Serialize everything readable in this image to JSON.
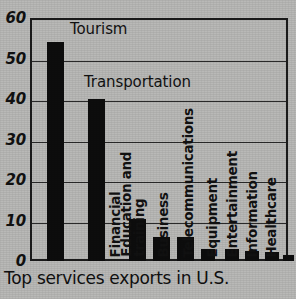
{
  "caption": "Top services exports in U.S.",
  "colors": {
    "background": "#b9b9b7",
    "bar": "#0d0d0d",
    "axis": "#1b1b1b",
    "grid": "#2a2a2a",
    "text": "#111111"
  },
  "axis": {
    "y_ticks": [
      "0",
      "10",
      "20",
      "30",
      "40",
      "50",
      "60"
    ]
  },
  "inline_labels": [
    {
      "text": "Tourism",
      "x": 70,
      "y": 20
    },
    {
      "text": "Transportation",
      "x": 84,
      "y": 73
    }
  ],
  "chart_data": {
    "type": "bar",
    "title": "Top services exports in U.S.",
    "xlabel": "",
    "ylabel": "",
    "ylim": [
      0,
      60
    ],
    "yticks": [
      0,
      10,
      20,
      30,
      40,
      50,
      60
    ],
    "grid": true,
    "legend": "none",
    "orientation": "vertical",
    "categories": [
      "Tourism",
      "Transportation",
      "Financial",
      "Education and training",
      "Business",
      "Telecommunications",
      "Equipment",
      "Entertainment",
      "Information",
      "Healthcare"
    ],
    "values": [
      54,
      40,
      10.3,
      6,
      6,
      3,
      3,
      2.5,
      2.2,
      1.5
    ],
    "bar_labels": [
      {
        "label": "Tourism",
        "placement": "inline-top",
        "lines": [
          "Tourism"
        ]
      },
      {
        "label": "Transportation",
        "placement": "inline-top",
        "lines": [
          "Transportation"
        ]
      },
      {
        "label": "Financial",
        "placement": "rotated",
        "lines": [
          "Financial"
        ]
      },
      {
        "label": "Education and training",
        "placement": "rotated",
        "lines": [
          "Education and",
          "training"
        ]
      },
      {
        "label": "Business",
        "placement": "rotated",
        "lines": [
          "Business"
        ]
      },
      {
        "label": "Telecommunications",
        "placement": "rotated",
        "lines": [
          "Telecommunications"
        ]
      },
      {
        "label": "Equipment",
        "placement": "rotated",
        "lines": [
          "Equipment"
        ]
      },
      {
        "label": "Entertainment",
        "placement": "rotated",
        "lines": [
          "Entertainment"
        ]
      },
      {
        "label": "Information",
        "placement": "rotated",
        "lines": [
          "Information"
        ]
      },
      {
        "label": "Healthcare",
        "placement": "rotated",
        "lines": [
          "Healthcare"
        ]
      }
    ]
  },
  "bar_geometry": [
    {
      "left": 17,
      "width": 17,
      "label_left": 35,
      "label_bottom": 4
    },
    {
      "left": 58,
      "width": 17,
      "label_left": 76,
      "label_bottom": 4
    },
    {
      "left": 99,
      "width": 17,
      "label_left": 92,
      "label_bottom": 4
    },
    {
      "left": 123,
      "width": 17,
      "label_left": 116,
      "label_bottom": 4
    },
    {
      "left": 147,
      "width": 17,
      "label_left": 140,
      "label_bottom": 4
    },
    {
      "left": 171,
      "width": 14,
      "label_left": 165,
      "label_bottom": 4
    },
    {
      "left": 195,
      "width": 14,
      "label_left": 189,
      "label_bottom": 4
    },
    {
      "left": 215,
      "width": 14,
      "label_left": 209,
      "label_bottom": 4
    },
    {
      "left": 235,
      "width": 14,
      "label_left": 229,
      "label_bottom": 4
    },
    {
      "left": 253,
      "width": 11,
      "label_left": 248,
      "label_bottom": 4
    }
  ]
}
